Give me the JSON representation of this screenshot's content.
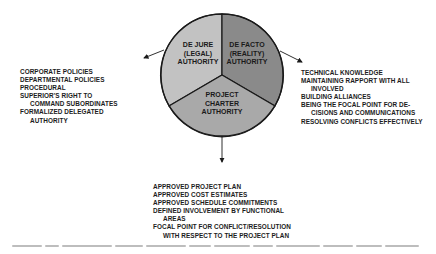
{
  "diagram": {
    "type": "pie-authority-diagram",
    "colors": {
      "de_jure_fill": "#c2c2c2",
      "de_facto_fill": "#8a8a8a",
      "project_charter_fill": "#a9a9a9",
      "outline": "#1a1a1a",
      "text": "#1c1c1c"
    },
    "segments": [
      {
        "id": "de-jure",
        "lines": [
          "DE JURE",
          "(LEGAL)",
          "AUTHORITY"
        ]
      },
      {
        "id": "de-facto",
        "lines": [
          "DE FACTO",
          "(REALITY)",
          "AUTHORITY"
        ]
      },
      {
        "id": "project-charter",
        "lines": [
          "PROJECT",
          "CHARTER",
          "AUTHORITY"
        ]
      }
    ],
    "left_list": [
      {
        "text": "CORPORATE POLICIES",
        "indent": false
      },
      {
        "text": "DEPARTMENTAL POLICIES",
        "indent": false
      },
      {
        "text": "PROCEDURAL",
        "indent": false
      },
      {
        "text": "SUPERIOR'S RIGHT TO",
        "indent": false
      },
      {
        "text": "COMMAND SUBORDINATES",
        "indent": true
      },
      {
        "text": "FORMALIZED DELEGATED",
        "indent": false
      },
      {
        "text": "AUTHORITY",
        "indent": true
      }
    ],
    "right_list": [
      {
        "text": "TECHNICAL KNOWLEDGE",
        "indent": false
      },
      {
        "text": "MAINTAINING RAPPORT WITH ALL",
        "indent": false
      },
      {
        "text": "INVOLVED",
        "indent": true
      },
      {
        "text": "BUILDING ALLIANCES",
        "indent": false
      },
      {
        "text": "BEING THE FOCAL POINT FOR DE-",
        "indent": false
      },
      {
        "text": "CISIONS AND COMMUNICATIONS",
        "indent": true
      },
      {
        "text": "RESOLVING CONFLICTS EFFECTIVELY",
        "indent": false
      }
    ],
    "bottom_list": [
      {
        "text": "APPROVED PROJECT PLAN",
        "indent": false
      },
      {
        "text": "APPROVED COST ESTIMATES",
        "indent": false
      },
      {
        "text": "APPROVED SCHEDULE COMMITMENTS",
        "indent": false
      },
      {
        "text": "DEFINED INVOLVEMENT BY FUNCTIONAL",
        "indent": false
      },
      {
        "text": "AREAS",
        "indent": true
      },
      {
        "text": "FOCAL POINT FOR CONFLICT/RESOLUTION",
        "indent": false
      },
      {
        "text": "WITH RESPECT TO THE PROJECT PLAN",
        "indent": true
      }
    ]
  }
}
